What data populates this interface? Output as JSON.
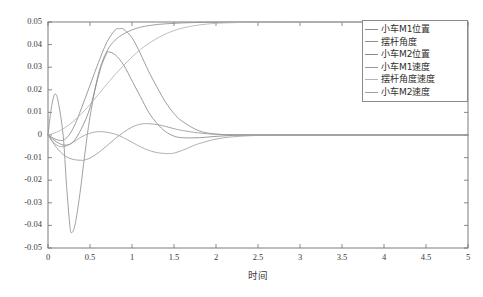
{
  "chart_data": {
    "type": "line",
    "title": "",
    "subtitle": "",
    "xlabel": "时间",
    "ylabel": "",
    "xlim": [
      0,
      5
    ],
    "ylim": [
      -0.05,
      0.05
    ],
    "xticks": [
      "0",
      "0.5",
      "1",
      "1.5",
      "2",
      "2.5",
      "3",
      "3.5",
      "4",
      "4.5",
      "5"
    ],
    "xtick_values": [
      0,
      0.5,
      1,
      1.5,
      2,
      2.5,
      3,
      3.5,
      4,
      4.5,
      5
    ],
    "yticks": [
      "0.05",
      "0.04",
      "0.03",
      "0.02",
      "0.01",
      "0",
      "-0.01",
      "-0.02",
      "-0.03",
      "-0.04",
      "-0.05"
    ],
    "ytick_values": [
      0.05,
      0.04,
      0.03,
      0.02,
      0.01,
      0,
      -0.01,
      -0.02,
      -0.03,
      -0.04,
      -0.05
    ],
    "grid": false,
    "legend_position": "upper right",
    "frame": true,
    "series": [
      {
        "name": "小车M1位置",
        "color": "#8c8c8c",
        "x": [
          0,
          0.1,
          0.2,
          0.3,
          0.4,
          0.5,
          0.6,
          0.7,
          0.8,
          0.85,
          0.9,
          1.0,
          1.1,
          1.2,
          1.3,
          1.4,
          1.5,
          1.6,
          1.8,
          2.0,
          2.2,
          2.4,
          2.6,
          2.8,
          3.0,
          3.5,
          4.0,
          4.5,
          5.0
        ],
        "y": [
          0.0,
          -0.002,
          -0.002,
          0.003,
          0.012,
          0.022,
          0.032,
          0.041,
          0.0465,
          0.047,
          0.0468,
          0.043,
          0.036,
          0.028,
          0.021,
          0.0145,
          0.0095,
          0.006,
          0.0018,
          0.0004,
          0.0001,
          5e-05,
          0.0,
          0.0,
          0.0,
          0.0,
          0.0,
          0.0,
          0.0
        ]
      },
      {
        "name": "摆杆角度",
        "color": "#909090",
        "x": [
          0,
          0.04,
          0.08,
          0.12,
          0.18,
          0.22,
          0.26,
          0.28,
          0.32,
          0.38,
          0.44,
          0.5,
          0.6,
          0.7,
          0.8,
          0.9,
          1.0,
          1.1,
          1.2,
          1.3,
          1.4,
          1.5,
          1.6,
          1.7,
          1.8,
          2.0,
          2.2,
          2.5,
          3.0,
          4.0,
          5.0
        ],
        "y": [
          0.0,
          0.012,
          0.018,
          0.015,
          0.0,
          -0.022,
          -0.04,
          -0.0432,
          -0.04,
          -0.026,
          -0.008,
          0.008,
          0.027,
          0.037,
          0.042,
          0.0447,
          0.0465,
          0.0477,
          0.0484,
          0.0489,
          0.0492,
          0.0494,
          0.0496,
          0.0497,
          0.0498,
          0.0499,
          0.04995,
          0.05,
          0.05,
          0.05,
          0.05
        ]
      },
      {
        "name": "小车M2位置",
        "color": "#8a8a8a",
        "x": [
          0,
          0.1,
          0.2,
          0.3,
          0.4,
          0.5,
          0.6,
          0.65,
          0.7,
          0.72,
          0.8,
          0.9,
          1.0,
          1.1,
          1.2,
          1.3,
          1.4,
          1.5,
          1.6,
          1.8,
          2.0,
          2.2,
          2.5,
          3.0,
          4.0,
          5.0
        ],
        "y": [
          0.0,
          -0.003,
          -0.0045,
          -0.003,
          0.003,
          0.012,
          0.026,
          0.032,
          0.0362,
          0.0368,
          0.0355,
          0.031,
          0.024,
          0.017,
          0.01,
          0.005,
          0.0015,
          -0.0005,
          -0.0012,
          -0.0012,
          -0.0006,
          -0.0002,
          0.0,
          0.0,
          0.0,
          0.0
        ]
      },
      {
        "name": "小车M1速度",
        "color": "#989898",
        "x": [
          0,
          0.1,
          0.2,
          0.3,
          0.4,
          0.42,
          0.5,
          0.6,
          0.7,
          0.8,
          0.9,
          1.0,
          1.1,
          1.15,
          1.2,
          1.3,
          1.4,
          1.5,
          1.6,
          1.8,
          2.0,
          2.2,
          2.5,
          3.0,
          4.0,
          5.0
        ],
        "y": [
          0.0,
          -0.0055,
          -0.0092,
          -0.0108,
          -0.0112,
          -0.0112,
          -0.0102,
          -0.0078,
          -0.0048,
          -0.0016,
          0.0012,
          0.0035,
          0.0048,
          0.005,
          0.005,
          0.0046,
          0.0038,
          0.0028,
          0.002,
          0.0009,
          0.0003,
          0.0001,
          0.0,
          0.0,
          0.0,
          0.0
        ]
      },
      {
        "name": "摆杆角度速度",
        "color": "#b4b4b4",
        "x": [
          0,
          0.1,
          0.2,
          0.3,
          0.4,
          0.5,
          0.6,
          0.7,
          0.8,
          0.9,
          1.0,
          1.1,
          1.2,
          1.3,
          1.4,
          1.5,
          1.6,
          1.7,
          1.8,
          1.9,
          2.0,
          2.2,
          2.4,
          2.6,
          3.0,
          3.5,
          4.0,
          4.5,
          5.0
        ],
        "y": [
          0.0,
          0.0012,
          0.0032,
          0.006,
          0.0095,
          0.0135,
          0.018,
          0.0225,
          0.0268,
          0.0308,
          0.0345,
          0.0378,
          0.0405,
          0.0428,
          0.0447,
          0.0462,
          0.0473,
          0.0481,
          0.0487,
          0.0491,
          0.0494,
          0.0497,
          0.0499,
          0.05,
          0.05,
          0.05,
          0.05,
          0.05,
          0.05
        ]
      },
      {
        "name": "小车M2速度",
        "color": "#a0a0a0",
        "x": [
          0,
          0.08,
          0.16,
          0.24,
          0.3,
          0.4,
          0.5,
          0.6,
          0.7,
          0.8,
          0.9,
          1.0,
          1.1,
          1.2,
          1.3,
          1.4,
          1.45,
          1.5,
          1.6,
          1.7,
          1.8,
          2.0,
          2.2,
          2.5,
          3.0,
          4.0,
          5.0
        ],
        "y": [
          0.0,
          -0.0038,
          -0.0052,
          -0.0045,
          -0.0032,
          -0.0008,
          0.0008,
          0.0015,
          0.0012,
          0.0004,
          -0.0012,
          -0.0032,
          -0.0052,
          -0.0068,
          -0.0078,
          -0.0082,
          -0.0082,
          -0.008,
          -0.0068,
          -0.0052,
          -0.0038,
          -0.0018,
          -0.0008,
          -0.0002,
          0.0,
          0.0,
          0.0
        ]
      }
    ]
  },
  "legend": {
    "items": [
      {
        "label": "小车M1位置"
      },
      {
        "label": "摆杆角度"
      },
      {
        "label": "小车M2位置"
      },
      {
        "label": "小车M1速度"
      },
      {
        "label": "摆杆角度速度"
      },
      {
        "label": "小车M2速度"
      }
    ]
  },
  "axes": {
    "x_title": "时间"
  }
}
